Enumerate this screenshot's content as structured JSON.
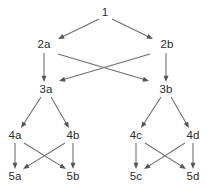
{
  "diagram": {
    "type": "directed-acyclic-graph",
    "title": "",
    "background_color": "#ffffff",
    "edge_color": "#6b6b73",
    "arrow_color": "#55555d",
    "label_color": "#2b2b2b",
    "nodes": [
      {
        "id": "n1",
        "label": "1",
        "x": 105,
        "y": 13,
        "level": 1
      },
      {
        "id": "n2a",
        "label": "2a",
        "x": 44,
        "y": 45,
        "level": 2
      },
      {
        "id": "n2b",
        "label": "2b",
        "x": 167,
        "y": 45,
        "level": 2
      },
      {
        "id": "n3a",
        "label": "3a",
        "x": 46,
        "y": 90,
        "level": 3
      },
      {
        "id": "n3b",
        "label": "3b",
        "x": 166,
        "y": 90,
        "level": 3
      },
      {
        "id": "n4a",
        "label": "4a",
        "x": 15,
        "y": 136,
        "level": 4
      },
      {
        "id": "n4b",
        "label": "4b",
        "x": 73,
        "y": 136,
        "level": 4
      },
      {
        "id": "n4c",
        "label": "4c",
        "x": 136,
        "y": 136,
        "level": 4
      },
      {
        "id": "n4d",
        "label": "4d",
        "x": 193,
        "y": 136,
        "level": 4
      },
      {
        "id": "n5a",
        "label": "5a",
        "x": 15,
        "y": 177,
        "level": 5
      },
      {
        "id": "n5b",
        "label": "5b",
        "x": 73,
        "y": 177,
        "level": 5
      },
      {
        "id": "n5c",
        "label": "5c",
        "x": 136,
        "y": 177,
        "level": 5
      },
      {
        "id": "n5d",
        "label": "5d",
        "x": 193,
        "y": 177,
        "level": 5
      }
    ],
    "edges": [
      {
        "from": "n1",
        "to": "n2a",
        "x1": 99,
        "y1": 19,
        "x2": 58,
        "y2": 39
      },
      {
        "from": "n1",
        "to": "n2b",
        "x1": 112,
        "y1": 19,
        "x2": 153,
        "y2": 39
      },
      {
        "from": "n2a",
        "to": "n3a",
        "x1": 44,
        "y1": 53,
        "x2": 44,
        "y2": 82
      },
      {
        "from": "n2b",
        "to": "n3b",
        "x1": 166,
        "y1": 53,
        "x2": 166,
        "y2": 82
      },
      {
        "from": "n2a",
        "to": "n3b",
        "x1": 58,
        "y1": 54,
        "x2": 149,
        "y2": 81
      },
      {
        "from": "n2b",
        "to": "n3a",
        "x1": 150,
        "y1": 54,
        "x2": 59,
        "y2": 81
      },
      {
        "from": "n3a",
        "to": "n4a",
        "x1": 41,
        "y1": 97,
        "x2": 21,
        "y2": 128
      },
      {
        "from": "n3a",
        "to": "n4b",
        "x1": 51,
        "y1": 97,
        "x2": 69,
        "y2": 128
      },
      {
        "from": "n3b",
        "to": "n4c",
        "x1": 161,
        "y1": 97,
        "x2": 141,
        "y2": 128
      },
      {
        "from": "n3b",
        "to": "n4d",
        "x1": 171,
        "y1": 97,
        "x2": 189,
        "y2": 128
      },
      {
        "from": "n4a",
        "to": "n5a",
        "x1": 15,
        "y1": 143,
        "x2": 15,
        "y2": 169
      },
      {
        "from": "n4b",
        "to": "n5b",
        "x1": 73,
        "y1": 143,
        "x2": 73,
        "y2": 169
      },
      {
        "from": "n4c",
        "to": "n5c",
        "x1": 136,
        "y1": 143,
        "x2": 136,
        "y2": 169
      },
      {
        "from": "n4d",
        "to": "n5d",
        "x1": 193,
        "y1": 143,
        "x2": 193,
        "y2": 169
      },
      {
        "from": "n4a",
        "to": "n5b",
        "x1": 24,
        "y1": 143,
        "x2": 66,
        "y2": 169
      },
      {
        "from": "n4b",
        "to": "n5a",
        "x1": 65,
        "y1": 143,
        "x2": 23,
        "y2": 169
      },
      {
        "from": "n4c",
        "to": "n5d",
        "x1": 145,
        "y1": 143,
        "x2": 186,
        "y2": 169
      },
      {
        "from": "n4d",
        "to": "n5c",
        "x1": 185,
        "y1": 143,
        "x2": 144,
        "y2": 169
      }
    ]
  }
}
